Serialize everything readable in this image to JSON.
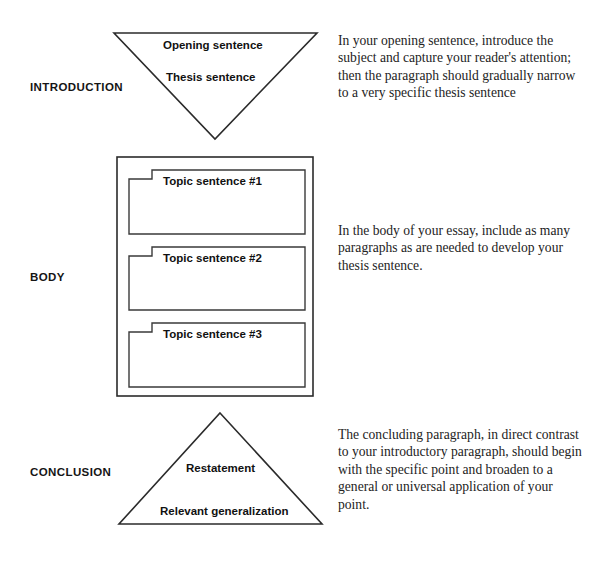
{
  "diagram": {
    "stages": [
      {
        "id": "introduction",
        "label": "INTRODUCTION",
        "shape": "inverted-triangle",
        "items": [
          "Opening sentence",
          "Thesis sentence"
        ],
        "description": "In your opening sentence, introduce the subject and capture your reader's attention; then the paragraph should gradually narrow to a very specific thesis sentence"
      },
      {
        "id": "body",
        "label": "BODY",
        "shape": "rectangle-with-nested-paragraphs",
        "items": [
          "Topic sentence #1",
          "Topic sentence #2",
          "Topic sentence #3"
        ],
        "description": "In the body of your essay, include as many paragraphs as are needed to develop your thesis sentence."
      },
      {
        "id": "conclusion",
        "label": "CONCLUSION",
        "shape": "triangle",
        "items": [
          "Restatement",
          "Relevant generalization"
        ],
        "description": "The concluding paragraph, in direct contrast to your introductory paragraph, should begin with the specific point and broaden to a general or universal application of your point."
      }
    ]
  },
  "style": {
    "stroke_color": "#2b2b2b",
    "background_color": "#ffffff",
    "label_color": "#151515",
    "description_color": "#232323"
  }
}
